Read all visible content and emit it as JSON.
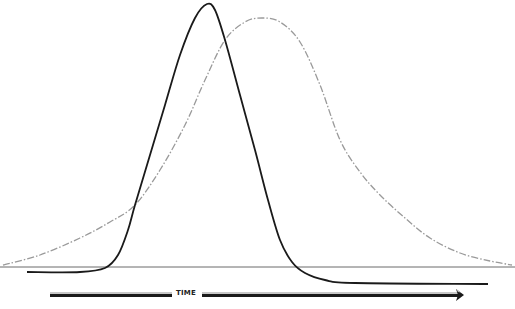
{
  "chart_data": {
    "type": "line",
    "title": "",
    "xlabel": "TIME",
    "ylabel": "",
    "grid": false,
    "legend": null,
    "axis_arrow": {
      "label": "TIME",
      "direction": "right"
    },
    "baseline_y_px": 267,
    "series": [
      {
        "name": "narrow-peak",
        "style": "solid",
        "color": "#1a1a1a",
        "points_px": [
          [
            27,
            272
          ],
          [
            80,
            272
          ],
          [
            105,
            268
          ],
          [
            118,
            255
          ],
          [
            128,
            230
          ],
          [
            135,
            205
          ],
          [
            150,
            155
          ],
          [
            165,
            105
          ],
          [
            180,
            55
          ],
          [
            195,
            18
          ],
          [
            207,
            4
          ],
          [
            215,
            10
          ],
          [
            225,
            40
          ],
          [
            240,
            95
          ],
          [
            255,
            150
          ],
          [
            268,
            200
          ],
          [
            280,
            240
          ],
          [
            292,
            262
          ],
          [
            305,
            273
          ],
          [
            325,
            280
          ],
          [
            355,
            283
          ],
          [
            488,
            284
          ]
        ]
      },
      {
        "name": "broad-peak",
        "style": "dash-dot",
        "color": "#9a9a9a",
        "points_px": [
          [
            3,
            265
          ],
          [
            40,
            255
          ],
          [
            80,
            238
          ],
          [
            110,
            222
          ],
          [
            135,
            205
          ],
          [
            160,
            170
          ],
          [
            185,
            125
          ],
          [
            205,
            80
          ],
          [
            225,
            40
          ],
          [
            245,
            22
          ],
          [
            262,
            18
          ],
          [
            280,
            22
          ],
          [
            300,
            42
          ],
          [
            320,
            85
          ],
          [
            340,
            140
          ],
          [
            360,
            172
          ],
          [
            380,
            195
          ],
          [
            405,
            218
          ],
          [
            430,
            238
          ],
          [
            460,
            253
          ],
          [
            490,
            261
          ],
          [
            512,
            265
          ]
        ]
      }
    ]
  }
}
